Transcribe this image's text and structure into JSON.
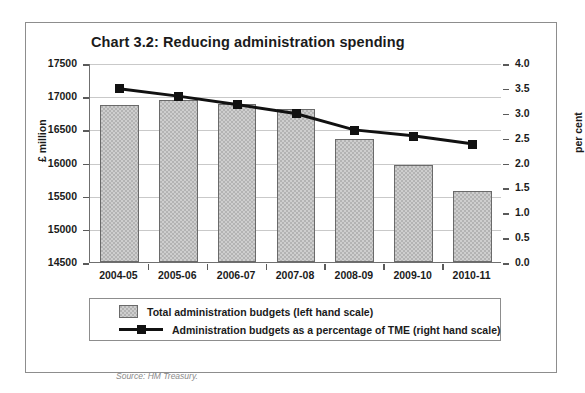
{
  "chart_data": {
    "type": "bar",
    "title": "Chart 3.2: Reducing administration spending",
    "xlabel": "",
    "ylabel": "£ million",
    "y2label": "per cent",
    "categories": [
      "2004-05",
      "2005-06",
      "2006-07",
      "2007-08",
      "2008-09",
      "2009-10",
      "2010-11"
    ],
    "ylim": [
      14500,
      17500
    ],
    "y2lim": [
      0.0,
      4.0
    ],
    "yticks": [
      "17500",
      "17000",
      "16500",
      "16000",
      "15500",
      "15000",
      "14500"
    ],
    "y2ticks": [
      "4.0",
      "3.5",
      "3.0",
      "2.5",
      "2.0",
      "1.5",
      "1.0",
      "0.5",
      "0.0"
    ],
    "grid": true,
    "legend_position": "below",
    "series": [
      {
        "name": "Total administration budgets (left hand scale)",
        "type": "bar",
        "axis": "left",
        "values": [
          16870,
          16950,
          16880,
          16810,
          16350,
          15960,
          15570
        ]
      },
      {
        "name": "Administration budgets as a percentage of TME (right hand scale)",
        "type": "line",
        "axis": "right",
        "values": [
          3.5,
          3.35,
          3.18,
          3.0,
          2.67,
          2.55,
          2.39
        ]
      }
    ],
    "source": "Source: HM Treasury.",
    "colors": {
      "bar_fill": "#b3b3b3",
      "bar_border": "#6a6a6a",
      "line": "#111111",
      "grid": "#c9c9c9",
      "axis": "#6f6f6f",
      "text": "#1b1b1b",
      "source_text": "#8a8a8a",
      "frame": "#8d8d8d",
      "background": "#ffffff"
    }
  }
}
